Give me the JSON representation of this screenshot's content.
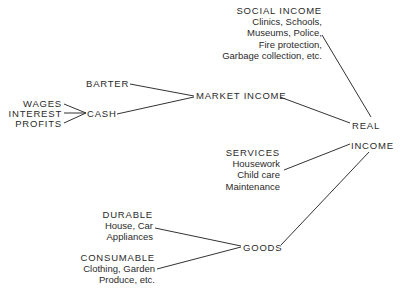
{
  "diagram": {
    "type": "tree",
    "root": "REAL INCOME",
    "line_color": "#333333",
    "nodes": {
      "social_income": {
        "title": "SOCIAL INCOME",
        "items": [
          "Clinics, Schools,",
          "Museums, Police,",
          "Fire protection,",
          "Garbage collection, etc."
        ]
      },
      "barter": "BARTER",
      "market_income": "MARKET INCOME",
      "wages": "WAGES",
      "interest": "INTEREST",
      "profits": "PROFITS",
      "cash": "CASH",
      "real": "REAL",
      "income": "INCOME",
      "services": {
        "title": "SERVICES",
        "items": [
          "Housework",
          "Child care",
          "Maintenance"
        ]
      },
      "durable": {
        "title": "DURABLE",
        "items": [
          "House, Car",
          "Appliances"
        ]
      },
      "consumable": {
        "title": "CONSUMABLE",
        "items": [
          "Clothing, Garden",
          "Produce, etc."
        ]
      },
      "goods": "GOODS"
    },
    "edges": [
      [
        "WAGES",
        "CASH"
      ],
      [
        "INTEREST",
        "CASH"
      ],
      [
        "PROFITS",
        "CASH"
      ],
      [
        "BARTER",
        "MARKET INCOME"
      ],
      [
        "CASH",
        "MARKET INCOME"
      ],
      [
        "SOCIAL INCOME",
        "REAL INCOME"
      ],
      [
        "MARKET INCOME",
        "REAL INCOME"
      ],
      [
        "SERVICES",
        "REAL INCOME"
      ],
      [
        "GOODS",
        "REAL INCOME"
      ],
      [
        "DURABLE",
        "GOODS"
      ],
      [
        "CONSUMABLE",
        "GOODS"
      ]
    ]
  }
}
